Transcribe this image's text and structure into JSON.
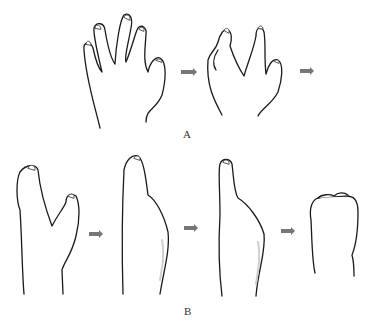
{
  "figure": {
    "panels": [
      {
        "label": "A",
        "stages": 2,
        "content": "Open hand with fingers spreading, progressing to clenched hand with reduced fingers"
      },
      {
        "label": "B",
        "stages": 4,
        "content": "Progression from two-digit hand, to single-digit mitten, to narrowing digit, to fist-like stump"
      }
    ],
    "arrow_color": "#777777",
    "line_color": "#1a1a1a"
  }
}
